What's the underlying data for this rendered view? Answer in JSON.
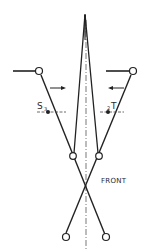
{
  "diagram": {
    "labels": {
      "front": "FRONT",
      "s": "S",
      "s_sub": "3",
      "t": "T",
      "t_sub": "2"
    },
    "colors": {
      "ink": "#222222",
      "background": "#ffffff",
      "axis": "#555555"
    }
  }
}
